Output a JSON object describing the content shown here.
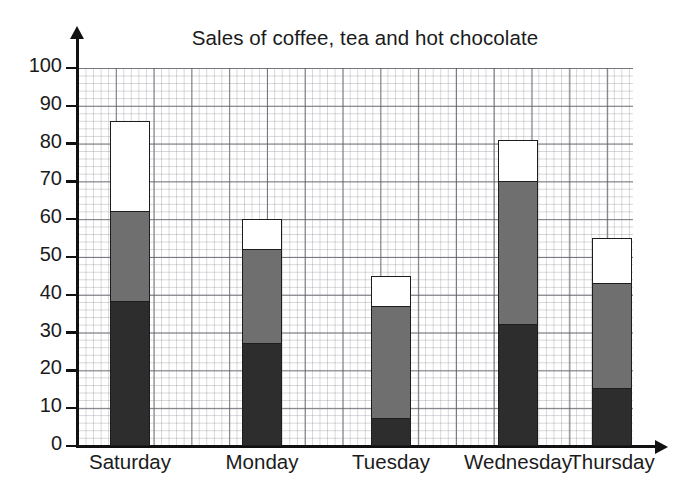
{
  "chart_data": {
    "type": "bar",
    "subtype": "stacked-bar",
    "title": "Sales of coffee, tea and hot chocolate",
    "xlabel": "",
    "ylabel": "",
    "categories": [
      "Saturday",
      "Monday",
      "Tuesday",
      "Wednesday",
      "Thursday"
    ],
    "series": [
      {
        "name": "coffee",
        "swatch": "#2d2d2d",
        "values": [
          38,
          27,
          7,
          32,
          15
        ]
      },
      {
        "name": "tea",
        "swatch": "#6f6f6f",
        "values": [
          24,
          25,
          30,
          38,
          28
        ]
      },
      {
        "name": "hot chocolate",
        "swatch": "#ffffff",
        "values": [
          24,
          8,
          8,
          11,
          12
        ]
      }
    ],
    "cumulative_tops": {
      "Saturday": [
        38,
        62,
        86
      ],
      "Monday": [
        27,
        52,
        60
      ],
      "Tuesday": [
        7,
        37,
        45
      ],
      "Wednesday": [
        32,
        70,
        81
      ],
      "Thursday": [
        15,
        43,
        55
      ]
    },
    "totals": [
      86,
      60,
      45,
      81,
      55
    ],
    "ylim": [
      0,
      100
    ],
    "ytick_labels": [
      "100",
      "90",
      "80",
      "70",
      "60",
      "50",
      "40",
      "30",
      "20",
      "10",
      "0"
    ],
    "ytick_values": [
      100,
      90,
      80,
      70,
      60,
      50,
      40,
      30,
      20,
      10,
      0
    ],
    "grid": true,
    "grid_minor": true,
    "legend": "none",
    "axis_arrows": true
  },
  "colors": {
    "ink": "#1b1b1b",
    "axis": "#111111",
    "grid_major": "#46464f",
    "grid_minor": "#787882",
    "background": "#ffffff"
  }
}
